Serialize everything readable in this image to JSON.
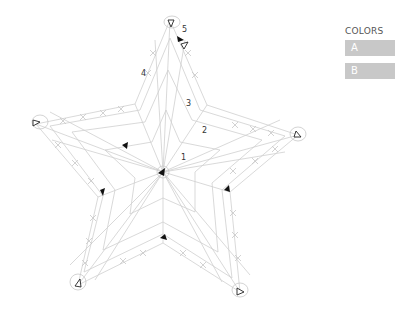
{
  "legend": {
    "title": "COLORS",
    "items": [
      {
        "label": "A",
        "color": "#c8c8c8"
      },
      {
        "label": "B",
        "color": "#c8c8c8"
      }
    ]
  },
  "diagram": {
    "type": "crochet star chart",
    "stitch_color": "#c4c4c4",
    "round_labels": [
      "1",
      "2",
      "3",
      "4",
      "5"
    ],
    "markers": {
      "start_arrow_color": "#111111",
      "end_marker": "open triangle"
    }
  }
}
